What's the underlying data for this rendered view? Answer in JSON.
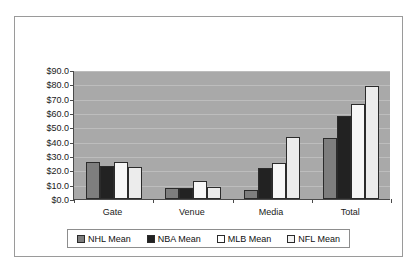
{
  "chart_data": {
    "type": "bar",
    "title": "",
    "xlabel": "",
    "ylabel": "",
    "categories": [
      "Gate",
      "Venue",
      "Media",
      "Total"
    ],
    "series": [
      {
        "name": "NHL Mean",
        "color": "#7e7e7e",
        "values": [
          25.7,
          8.0,
          6.5,
          42.7
        ]
      },
      {
        "name": "NBA Mean",
        "color": "#222222",
        "values": [
          23.0,
          7.5,
          21.5,
          58.0
        ]
      },
      {
        "name": "MLB Mean",
        "color": "#f7f7f7",
        "values": [
          26.0,
          12.3,
          25.3,
          66.5
        ]
      },
      {
        "name": "NFL Mean",
        "color": "#ececec",
        "values": [
          22.5,
          8.2,
          43.0,
          78.5
        ]
      }
    ],
    "ylim": [
      0,
      90
    ],
    "ytick_step": 10,
    "ytick_labels": [
      "$90.0",
      "$80.0",
      "$70.0",
      "$60.0",
      "$50.0",
      "$40.0",
      "$30.0",
      "$20.0",
      "$10.0",
      "$0.0"
    ],
    "ytick_values": [
      90,
      80,
      70,
      60,
      50,
      40,
      30,
      20,
      10,
      0
    ],
    "grid": true,
    "legend_position": "bottom",
    "plot_background": "#a9a9a9",
    "figure_background": "#ffffff",
    "border_color": "#9a9a9a"
  },
  "legend": {
    "items": [
      {
        "label": "NHL Mean"
      },
      {
        "label": "NBA Mean"
      },
      {
        "label": "MLB Mean"
      },
      {
        "label": "NFL Mean"
      }
    ]
  }
}
